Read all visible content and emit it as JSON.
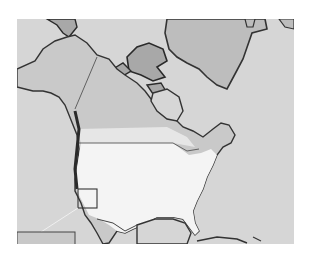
{
  "map": {
    "title": "",
    "region": "North America",
    "style": "grayscale",
    "colors": {
      "ocean": "#d6d6d6",
      "land_north": "#c9c9c9",
      "land_us": "#f4f4f4",
      "greenland": "#bdbdbd",
      "coastline": "#3a3a3a",
      "border": "#555555",
      "inset_line": "#f0f0f0"
    },
    "inset": {
      "label": "",
      "highlight_region": "California coast"
    }
  }
}
